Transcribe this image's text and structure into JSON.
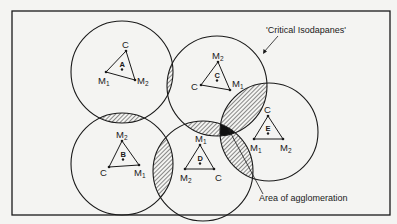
{
  "diagram": {
    "type": "Weber agglomeration / critical isodapanes",
    "frame": {
      "x": 12,
      "y": 11,
      "w": 378,
      "h": 204,
      "stroke": "#1a1a1a"
    },
    "colors": {
      "background": "#f4f4f2",
      "ink": "#1a1a1a",
      "hatch": "#1a1a1a"
    },
    "annotations": {
      "critical_isodapanes": "'Critical Isodapanes'",
      "area_of_agglomeration": "Area of agglomeration"
    },
    "circles": [
      {
        "id": "A",
        "cx": 122,
        "cy": 72,
        "r": 51
      },
      {
        "id": "C",
        "cx": 217,
        "cy": 86,
        "r": 50
      },
      {
        "id": "B",
        "cx": 122,
        "cy": 164,
        "r": 51
      },
      {
        "id": "D",
        "cx": 203,
        "cy": 171,
        "r": 50
      },
      {
        "id": "E",
        "cx": 269,
        "cy": 132,
        "r": 49
      }
    ],
    "firms": [
      {
        "id": "A",
        "letter": "A",
        "dot": [
          122,
          68
        ],
        "vertices": [
          {
            "label": "C",
            "sub": "",
            "x": 126,
            "y": 51,
            "lx": 122,
            "ly": 48
          },
          {
            "label": "M",
            "sub": "1",
            "x": 106,
            "y": 72,
            "lx": 98,
            "ly": 84
          },
          {
            "label": "M",
            "sub": "2",
            "x": 135,
            "y": 80,
            "lx": 137,
            "ly": 84
          }
        ]
      },
      {
        "id": "C",
        "letter": "C",
        "dot": [
          217,
          79
        ],
        "vertices": [
          {
            "label": "M",
            "sub": "2",
            "x": 218,
            "y": 62,
            "lx": 212,
            "ly": 59
          },
          {
            "label": "C",
            "sub": "",
            "x": 201,
            "y": 85,
            "lx": 191,
            "ly": 90
          },
          {
            "label": "M",
            "sub": "1",
            "x": 230,
            "y": 90,
            "lx": 232,
            "ly": 87
          }
        ]
      },
      {
        "id": "B",
        "letter": "B",
        "dot": [
          123,
          158
        ],
        "vertices": [
          {
            "label": "M",
            "sub": "2",
            "x": 122,
            "y": 141,
            "lx": 116,
            "ly": 138
          },
          {
            "label": "C",
            "sub": "",
            "x": 109,
            "y": 167,
            "lx": 100,
            "ly": 176
          },
          {
            "label": "M",
            "sub": "1",
            "x": 139,
            "y": 165,
            "lx": 134,
            "ly": 176
          }
        ]
      },
      {
        "id": "D",
        "letter": "D",
        "dot": [
          200,
          162
        ],
        "vertices": [
          {
            "label": "M",
            "sub": "1",
            "x": 200,
            "y": 145,
            "lx": 195,
            "ly": 142
          },
          {
            "label": "M",
            "sub": "2",
            "x": 185,
            "y": 169,
            "lx": 180,
            "ly": 181
          },
          {
            "label": "C",
            "sub": "",
            "x": 214,
            "y": 169,
            "lx": 215,
            "ly": 181
          }
        ]
      },
      {
        "id": "E",
        "letter": "E",
        "dot": [
          268,
          132
        ],
        "vertices": [
          {
            "label": "C",
            "sub": "",
            "x": 268,
            "y": 116,
            "lx": 264,
            "ly": 113
          },
          {
            "label": "M",
            "sub": "1",
            "x": 254,
            "y": 139,
            "lx": 250,
            "ly": 151
          },
          {
            "label": "M",
            "sub": "2",
            "x": 283,
            "y": 139,
            "lx": 280,
            "ly": 151
          }
        ]
      }
    ],
    "overlaps_hatched": [
      "A-C",
      "A-B",
      "B-D",
      "C-D",
      "C-E",
      "D-E"
    ],
    "agglomeration_zone": "C ∩ D ∩ E (solid black)"
  }
}
